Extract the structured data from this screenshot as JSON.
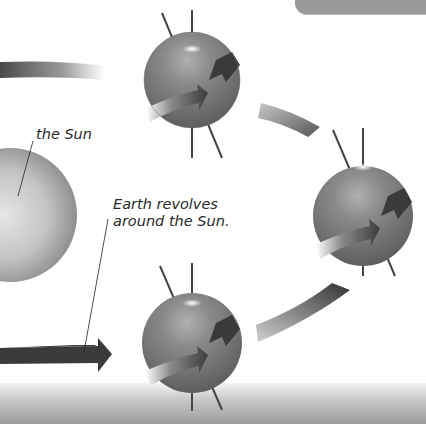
{
  "diagram": {
    "title_tab": "",
    "labels": {
      "sun": "the Sun",
      "revolve_line1": "Earth revolves",
      "revolve_line2": "around the Sun."
    },
    "bodies": [
      {
        "name": "sun",
        "cx": 10,
        "cy": 215,
        "r": 67
      },
      {
        "name": "earth-top",
        "cx": 192,
        "cy": 80,
        "r": 48
      },
      {
        "name": "earth-right",
        "cx": 363,
        "cy": 216,
        "r": 50
      },
      {
        "name": "earth-bottom",
        "cx": 192,
        "cy": 343,
        "r": 50
      }
    ],
    "colors": {
      "background": "#ffffff",
      "earth": "#7a7a7a",
      "sun": "#bdbdbd",
      "arrow_dark": "#3a3a3a",
      "axis": "#444444",
      "tab": "#9a9a9a"
    }
  }
}
